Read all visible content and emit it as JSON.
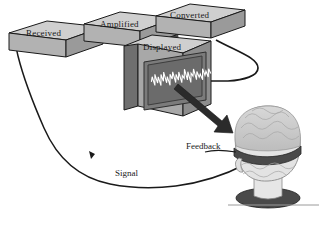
{
  "diagram": {
    "background_color": "#ffffff",
    "stroke_color": "#1a1a1a",
    "box_top_color": "#cfcfcf",
    "box_front_color": "#a8a8a8",
    "box_side_color": "#8d8d8d",
    "screen_color": "#6e6e6e",
    "screen_bezel_color": "#4a4a4a",
    "wave_color": "#ffffff",
    "head_color": "#e6e6e6",
    "hair_color": "#c8c8c8",
    "band_color": "#4a4a4a",
    "arrow_color": "#2b2b2b"
  },
  "boxes": [
    {
      "id": "received",
      "label": "Received"
    },
    {
      "id": "amplified",
      "label": "Amplified"
    },
    {
      "id": "converted",
      "label": "Converted"
    },
    {
      "id": "displayed",
      "label": "Displayed"
    }
  ],
  "flow_labels": [
    {
      "id": "signal",
      "label": "Signal"
    },
    {
      "id": "feedback",
      "label": "Feedback"
    }
  ],
  "monitor": {
    "waveform_name": "eeg-waveform",
    "waveform_points": "0,10 1.5,5 3,14 4.5,3 6,12 7.5,6 9,15 10.5,4 12,11 13.5,2 15,13 16.5,7 18,16 19.5,5 21,10 22.5,3 24,14 25.5,6 27,12 28.5,4 30,15 31.5,8 33,11 34.5,2 36,13 37.5,5 39,16 40.5,7 42,10 43.5,3 45,14 46.5,6 48,12 49.5,9 51,15 52.5,4 54,11 55.5,7 57,13 58.5,5 60,10"
  }
}
